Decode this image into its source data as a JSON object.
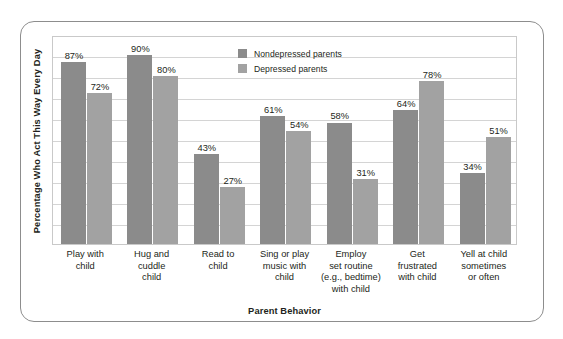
{
  "chart_data": {
    "type": "bar",
    "title": "",
    "xlabel": "Parent Behavior",
    "ylabel": "Percentage Who Act This Way Every Day",
    "ylim": [
      0,
      100
    ],
    "grid": true,
    "legend_position": "top-center",
    "categories": [
      "Play with child",
      "Hug and cuddle child",
      "Read to child",
      "Sing or play music with child",
      "Employ set routine (e.g., bedtime) with child",
      "Get frustrated with child",
      "Yell at child sometimes or often"
    ],
    "category_lines": [
      [
        "Play with",
        "child"
      ],
      [
        "Hug and",
        "cuddle",
        "child"
      ],
      [
        "Read to",
        "child"
      ],
      [
        "Sing or play",
        "music with",
        "child"
      ],
      [
        "Employ",
        "set routine",
        "(e.g., bedtime)",
        "with child"
      ],
      [
        "Get",
        "frustrated",
        "with child"
      ],
      [
        "Yell at child",
        "sometimes",
        "or often"
      ]
    ],
    "series": [
      {
        "name": "Nondepressed parents",
        "color": "#8b8b8b",
        "values": [
          87,
          90,
          43,
          61,
          58,
          64,
          34
        ],
        "labels": [
          "87%",
          "90%",
          "43%",
          "61%",
          "58%",
          "64%",
          "34%"
        ]
      },
      {
        "name": "Depressed parents",
        "color": "#a2a2a2",
        "values": [
          72,
          80,
          27,
          54,
          31,
          78,
          51
        ],
        "labels": [
          "72%",
          "80%",
          "27%",
          "54%",
          "31%",
          "78%",
          "51%"
        ]
      }
    ],
    "gridline_values": [
      10,
      20,
      30,
      40,
      50,
      60,
      70,
      80,
      90
    ]
  }
}
